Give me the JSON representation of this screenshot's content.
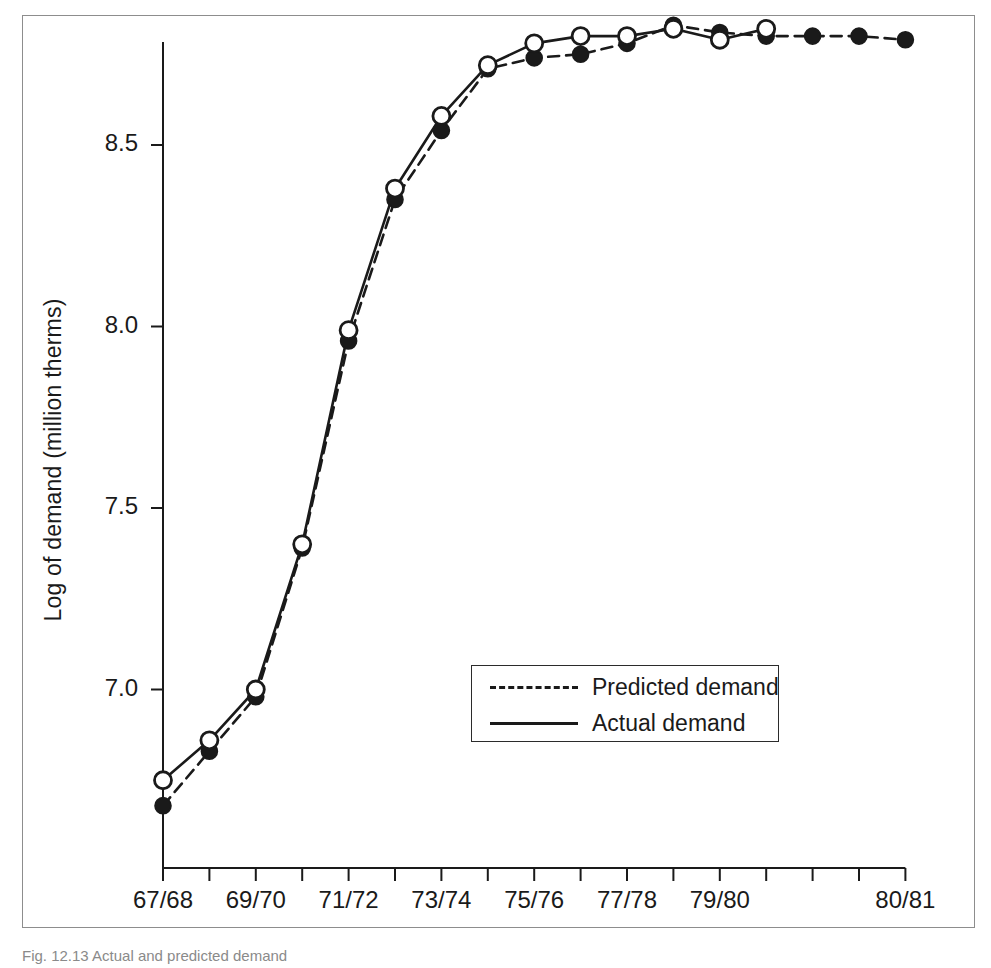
{
  "figure": {
    "caption": "Fig. 12.13 Actual and predicted demand",
    "border_color": "#8d8d8d",
    "ink_color": "#1a1a1a"
  },
  "chart_data": {
    "type": "line",
    "title": "",
    "xlabel": "",
    "ylabel": "Log of demand (million therms)",
    "ylim": [
      6.55,
      8.93
    ],
    "xlim": [
      0,
      16
    ],
    "grid": false,
    "legend_position": "center-right-lower",
    "y_ticks": [
      "7.0",
      "7.5",
      "8.0",
      "8.5"
    ],
    "y_tick_values": [
      7.0,
      7.5,
      8.0,
      8.5
    ],
    "x_tick_positions": [
      0,
      1,
      2,
      3,
      4,
      5,
      6,
      7,
      8,
      9,
      10,
      11,
      12,
      13,
      14,
      15,
      16
    ],
    "x_tick_labels": [
      "67/68",
      "",
      "69/70",
      "",
      "71/72",
      "",
      "73/74",
      "",
      "75/76",
      "",
      "77/78",
      "",
      "79/80",
      "",
      "",
      "",
      "80/81"
    ],
    "categories": [
      "67/68",
      "68/69",
      "69/70",
      "70/71",
      "71/72",
      "72/73",
      "73/74",
      "74/75",
      "75/76",
      "76/77",
      "77/78",
      "78/79",
      "79/80",
      "80/81",
      "81/82",
      "82/83",
      "83/84"
    ],
    "series": [
      {
        "name": "Predicted demand",
        "marker": "filled-circle",
        "line_style": "dashed",
        "x": [
          0,
          1,
          2,
          3,
          4,
          5,
          6,
          7,
          8,
          9,
          10,
          11,
          12,
          13,
          14,
          15,
          16
        ],
        "values": [
          6.68,
          6.83,
          6.98,
          7.39,
          7.96,
          8.35,
          8.54,
          8.71,
          8.74,
          8.75,
          8.78,
          8.83,
          8.81,
          8.8,
          8.8,
          8.8,
          8.79
        ]
      },
      {
        "name": "Actual demand",
        "marker": "open-circle",
        "line_style": "solid",
        "x": [
          0,
          1,
          2,
          3,
          4,
          5,
          6,
          7,
          8,
          9,
          10,
          11,
          12,
          13
        ],
        "values": [
          6.75,
          6.86,
          7.0,
          7.4,
          7.99,
          8.38,
          8.58,
          8.72,
          8.78,
          8.8,
          8.8,
          8.82,
          8.79,
          8.82
        ]
      }
    ]
  },
  "legend": {
    "entries": [
      {
        "label": "Predicted demand",
        "style": "dashed"
      },
      {
        "label": "Actual demand",
        "style": "solid"
      }
    ]
  }
}
